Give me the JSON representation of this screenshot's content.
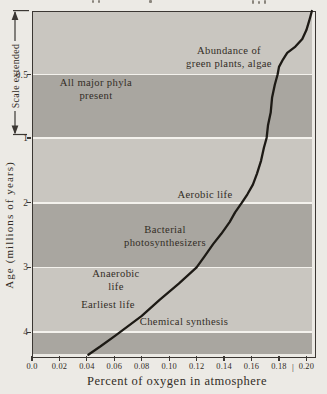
{
  "colors": {
    "background": "#eceae5",
    "band_light": "#c9c6c0",
    "band_dark": "#a9a6a0",
    "separator": "#f4f2ed",
    "ink": "#332d26",
    "border": "#3b3733",
    "curve": "#1d1a15"
  },
  "chart_data": {
    "type": "line",
    "title": "",
    "xlabel": "Percent of oxygen in atmosphere",
    "ylabel": "Age (millions of years)",
    "y_scale_note": "Scale extended",
    "x_tick_labels": [
      "0.0",
      "0.02",
      "0.04",
      "0.06",
      "0.08",
      "0.10",
      "0.12",
      "0.14",
      "0.16",
      "0.18",
      "0.20"
    ],
    "x_tick_values": [
      0.0,
      0.02,
      0.04,
      0.06,
      0.08,
      0.1,
      0.12,
      0.14,
      0.16,
      0.18,
      0.2
    ],
    "x_axis_break_mark": "|",
    "y_tick_labels": [
      "0.5",
      "1",
      "2",
      "3",
      "4"
    ],
    "y_tick_ages": [
      0.5,
      1,
      2,
      3,
      4
    ],
    "xlim": [
      0,
      0.205
    ],
    "ylim_age": [
      0,
      4.35
    ],
    "y_scale": "age 0–1 drawn at 2× vertical scale (“Scale extended”); ages 1–4.35 linear; age increases downward",
    "grid": "alternating gray horizontal bands separated by white rules at ages 0.5, 1, 2, 3, 4",
    "legend": "none",
    "series": [
      {
        "name": "oxygen-concentration-curve",
        "points_oxygen_age": [
          [
            0.204,
            0.0
          ],
          [
            0.202,
            0.08
          ],
          [
            0.2,
            0.15
          ],
          [
            0.197,
            0.22
          ],
          [
            0.192,
            0.28
          ],
          [
            0.186,
            0.33
          ],
          [
            0.183,
            0.38
          ],
          [
            0.18,
            0.44
          ],
          [
            0.179,
            0.5
          ],
          [
            0.177,
            0.58
          ],
          [
            0.175,
            0.68
          ],
          [
            0.174,
            0.8
          ],
          [
            0.172,
            0.9
          ],
          [
            0.171,
            1.0
          ],
          [
            0.169,
            1.15
          ],
          [
            0.167,
            1.35
          ],
          [
            0.164,
            1.55
          ],
          [
            0.161,
            1.72
          ],
          [
            0.157,
            1.87
          ],
          [
            0.153,
            2.0
          ],
          [
            0.148,
            2.15
          ],
          [
            0.144,
            2.3
          ],
          [
            0.138,
            2.48
          ],
          [
            0.132,
            2.64
          ],
          [
            0.126,
            2.82
          ],
          [
            0.12,
            3.0
          ],
          [
            0.107,
            3.25
          ],
          [
            0.093,
            3.5
          ],
          [
            0.08,
            3.75
          ],
          [
            0.061,
            4.05
          ],
          [
            0.05,
            4.22
          ],
          [
            0.041,
            4.35
          ]
        ]
      }
    ],
    "bands": [
      {
        "from_age": 0.0,
        "to_age": 0.5,
        "shade": "light"
      },
      {
        "from_age": 0.5,
        "to_age": 1.0,
        "shade": "dark"
      },
      {
        "from_age": 1.0,
        "to_age": 2.0,
        "shade": "light"
      },
      {
        "from_age": 2.0,
        "to_age": 3.0,
        "shade": "dark"
      },
      {
        "from_age": 3.0,
        "to_age": 4.0,
        "shade": "light"
      },
      {
        "from_age": 4.0,
        "to_age": 4.35,
        "shade": "dark"
      }
    ],
    "annotations": [
      {
        "text": "Abundance of\ngreen plants, algae"
      },
      {
        "text": "All major phyla\npresent"
      },
      {
        "text": "Aerobic life"
      },
      {
        "text": "Bacterial\nphotosynthesizers"
      },
      {
        "text": "Anaerobic\nlife"
      },
      {
        "text": "Earliest life"
      },
      {
        "text": "Chemical synthesis"
      }
    ]
  }
}
